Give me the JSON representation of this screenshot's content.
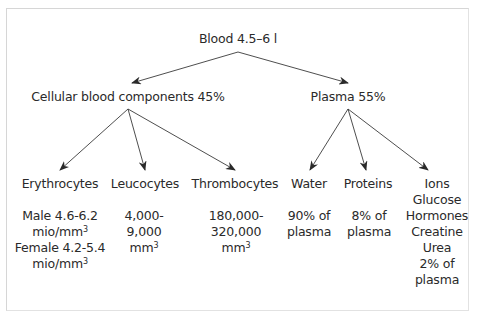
{
  "diagram": {
    "root": {
      "label": "Blood 4.5–6 l"
    },
    "branches": [
      {
        "label": "Cellular blood components 45%",
        "children": [
          {
            "label": "Erythrocytes",
            "details": [
              "Male 4.6-6.2",
              "mio/mm",
              "Female 4.2-5.4",
              "mio/mm"
            ],
            "superscripts": [
              "",
              "3",
              "",
              "3"
            ]
          },
          {
            "label": "Leucocytes",
            "details": [
              "4,000-",
              "9,000",
              "mm"
            ],
            "superscripts": [
              "",
              "",
              "3"
            ]
          },
          {
            "label": "Thrombocytes",
            "details": [
              "180,000-",
              "320,000",
              "mm"
            ],
            "superscripts": [
              "",
              "",
              "3"
            ]
          }
        ]
      },
      {
        "label": "Plasma 55%",
        "children": [
          {
            "label": "Water",
            "details": [
              "90% of",
              "plasma"
            ]
          },
          {
            "label": "Proteins",
            "details": [
              "8% of",
              "plasma"
            ]
          },
          {
            "label": "Ions",
            "details": [
              "Glucose",
              "Hormones",
              "Creatine",
              "Urea",
              "2% of",
              "plasma"
            ]
          }
        ]
      }
    ],
    "colors": {
      "line": "#3a3a3a",
      "text": "#2a2a2a",
      "frame": "#d6d6d6"
    }
  }
}
